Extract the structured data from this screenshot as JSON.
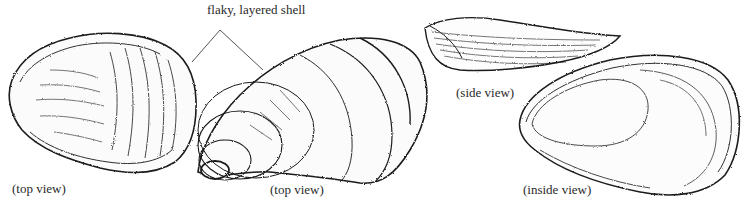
{
  "figure": {
    "callout": {
      "text": "flaky, layered shell"
    },
    "views": [
      {
        "id": "top-view-1",
        "label": "(top view)"
      },
      {
        "id": "top-view-2",
        "label": "(top view)"
      },
      {
        "id": "side-view",
        "label": "(side view)"
      },
      {
        "id": "inside-view",
        "label": "(inside view)"
      }
    ]
  },
  "colors": {
    "ink": "#1a1a1a",
    "background": "#ffffff",
    "label": "#2a2a2a"
  }
}
